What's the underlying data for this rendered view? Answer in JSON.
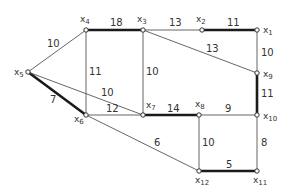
{
  "diagram": {
    "type": "weighted-graph",
    "nodes": [
      {
        "id": "x1",
        "label": "x",
        "sub": "1",
        "x": 257,
        "y": 30,
        "lx": 263,
        "ly": 33
      },
      {
        "id": "x2",
        "label": "x",
        "sub": "2",
        "x": 202,
        "y": 30,
        "lx": 196,
        "ly": 22
      },
      {
        "id": "x3",
        "label": "x",
        "sub": "3",
        "x": 143,
        "y": 30,
        "lx": 137,
        "ly": 22
      },
      {
        "id": "x4",
        "label": "x",
        "sub": "4",
        "x": 86,
        "y": 30,
        "lx": 80,
        "ly": 22
      },
      {
        "id": "x5",
        "label": "x",
        "sub": "5",
        "x": 28,
        "y": 72,
        "lx": 14,
        "ly": 75
      },
      {
        "id": "x6",
        "label": "x",
        "sub": "6",
        "x": 86,
        "y": 115,
        "lx": 74,
        "ly": 122
      },
      {
        "id": "x7",
        "label": "x",
        "sub": "7",
        "x": 143,
        "y": 115,
        "lx": 146,
        "ly": 108
      },
      {
        "id": "x8",
        "label": "x",
        "sub": "8",
        "x": 199,
        "y": 115,
        "lx": 195,
        "ly": 107
      },
      {
        "id": "x9",
        "label": "x",
        "sub": "9",
        "x": 257,
        "y": 73,
        "lx": 263,
        "ly": 77
      },
      {
        "id": "x10",
        "label": "x",
        "sub": "10",
        "x": 257,
        "y": 115,
        "lx": 263,
        "ly": 119
      },
      {
        "id": "x11",
        "label": "x",
        "sub": "11",
        "x": 257,
        "y": 171,
        "lx": 253,
        "ly": 183
      },
      {
        "id": "x12",
        "label": "x",
        "sub": "12",
        "x": 199,
        "y": 171,
        "lx": 195,
        "ly": 183
      }
    ],
    "edges": [
      {
        "from": "x4",
        "to": "x3",
        "weight": "18",
        "bold": true,
        "lx": 110,
        "ly": 26
      },
      {
        "from": "x3",
        "to": "x2",
        "weight": "13",
        "bold": false,
        "lx": 169,
        "ly": 26
      },
      {
        "from": "x2",
        "to": "x1",
        "weight": "11",
        "bold": true,
        "lx": 227,
        "ly": 26
      },
      {
        "from": "x1",
        "to": "x9",
        "weight": "10",
        "bold": false,
        "lx": 261,
        "ly": 56
      },
      {
        "from": "x3",
        "to": "x9",
        "weight": "13",
        "bold": false,
        "lx": 206,
        "ly": 52
      },
      {
        "from": "x9",
        "to": "x10",
        "weight": "11",
        "bold": true,
        "lx": 261,
        "ly": 97
      },
      {
        "from": "x5",
        "to": "x4",
        "weight": "10",
        "bold": false,
        "lx": 47,
        "ly": 47
      },
      {
        "from": "x4",
        "to": "x6",
        "weight": "11",
        "bold": false,
        "lx": 89,
        "ly": 75
      },
      {
        "from": "x3",
        "to": "x7",
        "weight": "10",
        "bold": false,
        "lx": 146,
        "ly": 75
      },
      {
        "from": "x5",
        "to": "x6",
        "weight": "7",
        "bold": true,
        "lx": 50,
        "ly": 103
      },
      {
        "from": "x5",
        "to": "x7",
        "weight": "10",
        "bold": false,
        "lx": 101,
        "ly": 96
      },
      {
        "from": "x6",
        "to": "x7",
        "weight": "12",
        "bold": false,
        "lx": 106,
        "ly": 112
      },
      {
        "from": "x7",
        "to": "x8",
        "weight": "14",
        "bold": true,
        "lx": 167,
        "ly": 112
      },
      {
        "from": "x8",
        "to": "x10",
        "weight": "9",
        "bold": false,
        "lx": 225,
        "ly": 112
      },
      {
        "from": "x6",
        "to": "x12",
        "weight": "6",
        "bold": false,
        "lx": 154,
        "ly": 146
      },
      {
        "from": "x8",
        "to": "x12",
        "weight": "10",
        "bold": false,
        "lx": 202,
        "ly": 146
      },
      {
        "from": "x10",
        "to": "x11",
        "weight": "8",
        "bold": false,
        "lx": 261,
        "ly": 146
      },
      {
        "from": "x12",
        "to": "x11",
        "weight": "5",
        "bold": true,
        "lx": 226,
        "ly": 168
      }
    ]
  }
}
